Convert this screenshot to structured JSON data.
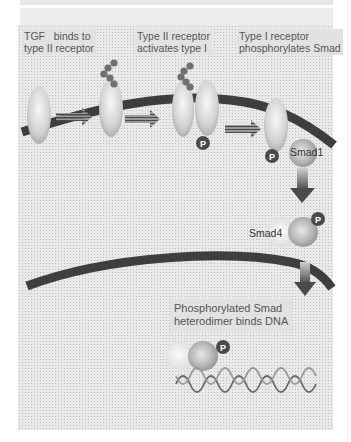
{
  "diagram": {
    "captions": [
      {
        "id": "step1",
        "line1": "TGF   binds to",
        "line2": "type II receptor"
      },
      {
        "id": "step2",
        "line1": "Type II receptor",
        "line2": "activates type I"
      },
      {
        "id": "step3",
        "line1": "Type I receptor",
        "line2": "phosphorylates Smad"
      },
      {
        "id": "step4",
        "line1": "Phosphorylated Smad",
        "line2": "heterodimer binds DNA"
      }
    ],
    "molecules": {
      "smad1": "Smad1",
      "smad4": "Smad4",
      "phospho": "P"
    },
    "structures": [
      "cell-membrane",
      "nuclear-membrane",
      "dna-helix"
    ],
    "colors": {
      "membrane": "#3e3e3e",
      "receptor": "#d9d9d9",
      "ligand": "#6f6f6f",
      "phospho_badge": "#4a4a4a",
      "panel_bg": "#e9e9e9"
    }
  }
}
